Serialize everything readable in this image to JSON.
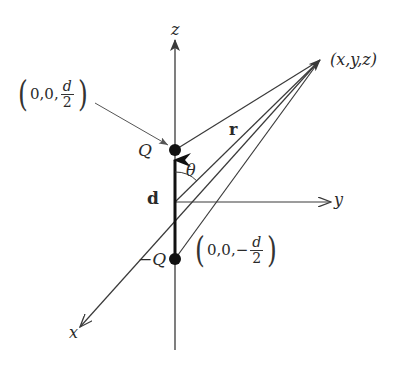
{
  "diagram": {
    "axes": {
      "z": {
        "label": "z"
      },
      "y": {
        "label": "y"
      },
      "x": {
        "label": "x"
      }
    },
    "charges": {
      "positive": {
        "label": "Q",
        "coord_prefix": "0,0,",
        "coord_num": "d",
        "coord_den": "2"
      },
      "negative": {
        "label": "−Q",
        "coord_prefix": "0,0,−",
        "coord_num": "d",
        "coord_den": "2"
      }
    },
    "vectors": {
      "dipole": {
        "label": "d"
      },
      "position": {
        "label": "r"
      }
    },
    "angle": {
      "label": "θ"
    },
    "field_point": {
      "label": "(x,y,z)"
    },
    "parens": {
      "open": "(",
      "close": ")"
    },
    "colors": {
      "line": "#3a3a3a",
      "dot": "#111111",
      "text": "#2a2a2a"
    }
  }
}
